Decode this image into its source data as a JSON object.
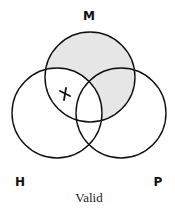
{
  "diagram": {
    "type": "venn-3",
    "labels": {
      "M": "M",
      "H": "H",
      "P": "P"
    },
    "caption": "Valid",
    "shaded_region": "M outside H",
    "marker": {
      "symbol": "X",
      "region": "M ∩ H outside P"
    },
    "colors": {
      "shade": "#e6e6e6",
      "stroke": "#111111"
    }
  }
}
